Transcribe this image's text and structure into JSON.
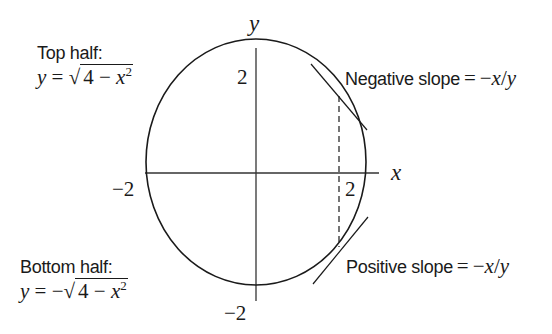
{
  "diagram": {
    "type": "circle-implicit-differentiation",
    "equation": "x^2 + y^2 = 4",
    "colors": {
      "ink": "#1a1a1a",
      "background": "#ffffff"
    },
    "axes": {
      "x_label": "x",
      "y_label": "y",
      "ticks": {
        "x_positive": "2",
        "x_negative": "−2",
        "y_positive": "2",
        "y_negative": "−2"
      }
    },
    "annotations": {
      "top_half": {
        "title": "Top half:",
        "lhs": "y",
        "equals": "=",
        "sign": "",
        "radical_symbol": "√",
        "radicand_const": "4",
        "radicand_minus": "−",
        "radicand_var": "x",
        "exponent": "2"
      },
      "bottom_half": {
        "title": "Bottom half:",
        "lhs": "y",
        "equals": "=",
        "sign": "−",
        "radical_symbol": "√",
        "radicand_const": "4",
        "radicand_minus": "−",
        "radicand_var": "x",
        "exponent": "2"
      },
      "negative_slope": {
        "text": "Negative slope",
        "equals": "=",
        "formula_minus": "−",
        "formula_x": "x",
        "formula_slash": "/",
        "formula_y": "y"
      },
      "positive_slope": {
        "text": "Positive slope",
        "equals": "=",
        "formula_minus": "−",
        "formula_x": "x",
        "formula_slash": "/",
        "formula_y": "y"
      }
    },
    "elements": {
      "circle": "radius 2 centered at origin",
      "tangent_upper": "tangent line at upper-right point (negative slope)",
      "tangent_lower": "tangent line at lower-right point (positive slope)",
      "dashed_vertical": "vertical dashed line connecting the two tangent points"
    }
  }
}
